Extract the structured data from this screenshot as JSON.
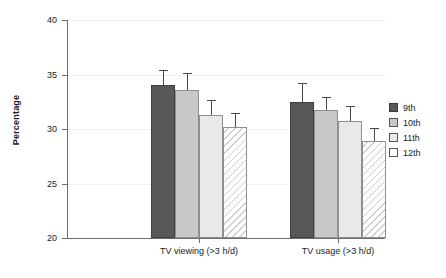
{
  "chart_data": {
    "type": "bar",
    "title": "",
    "xlabel": "",
    "ylabel": "Percentage",
    "ylim": [
      20,
      40
    ],
    "yticks": [
      20,
      25,
      30,
      35,
      40
    ],
    "ytick_labels": [
      "20",
      "25",
      "30",
      "35",
      "40"
    ],
    "grid": true,
    "grid_axis": "y",
    "legend_position": "right",
    "categories": [
      "TV viewing (>3 h/d)",
      "TV usage (>3 h/d)"
    ],
    "series": [
      {
        "name": "9th",
        "color": "#585858",
        "values": [
          34.0,
          32.5
        ],
        "errors": [
          1.4,
          1.7
        ]
      },
      {
        "name": "10th",
        "color": "#c8c8c8",
        "values": [
          33.6,
          31.7
        ],
        "errors": [
          1.5,
          1.2
        ]
      },
      {
        "name": "11th",
        "color": "#e9e9e9",
        "values": [
          31.3,
          30.7
        ],
        "errors": [
          1.4,
          1.4
        ]
      },
      {
        "name": "12th",
        "color": "#ffffff",
        "values": [
          30.2,
          28.9
        ],
        "errors": [
          1.3,
          1.2
        ]
      }
    ]
  },
  "axes": {
    "y_title": "Percentage"
  },
  "legend": {
    "items": [
      {
        "label": "9th"
      },
      {
        "label": "10th"
      },
      {
        "label": "11th"
      },
      {
        "label": "12th"
      }
    ]
  }
}
